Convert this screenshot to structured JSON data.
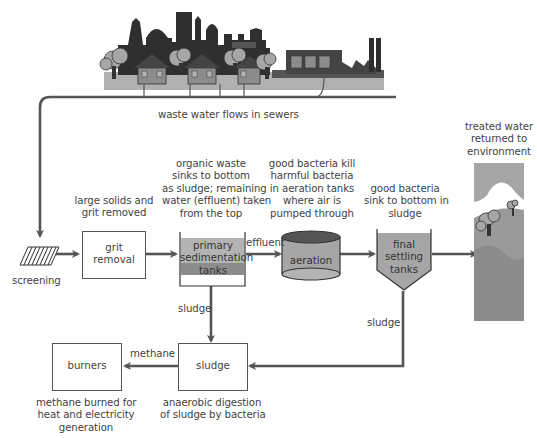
{
  "diagram": {
    "colors": {
      "line": "#555555",
      "silhouette": "#2f2f2f",
      "mid_gray": "#8c8c8c",
      "light_gray": "#b3b3b3",
      "box_fill": "#ffffff",
      "tank_fill": "#a6a6a6",
      "tank_sludge": "#7f7f7f"
    },
    "top_label": "waste water flows in sewers",
    "nodes": {
      "screening": {
        "label": "screening"
      },
      "grit_removal": {
        "label_line1": "grit",
        "label_line2": "removal",
        "note_line1": "large solids and",
        "note_line2": "grit removed"
      },
      "primary": {
        "label_line1": "primary",
        "label_line2": "sedimentation",
        "label_line3": "tanks",
        "note_line1": "organic waste",
        "note_line2": "sinks to bottom",
        "note_line3": "as sludge; remaining",
        "note_line4": "water (effluent) taken",
        "note_line5": "from the top"
      },
      "aeration": {
        "label": "aeration",
        "note_line1": "good bacteria kill",
        "note_line2": "harmful bacteria",
        "note_line3": "in aeration tanks",
        "note_line4": "where air is",
        "note_line5": "pumped through"
      },
      "final_settling": {
        "label_line1": "final",
        "label_line2": "settling",
        "label_line3": "tanks",
        "note_line1": "good bacteria",
        "note_line2": "sink to bottom in",
        "note_line3": "sludge"
      },
      "environment": {
        "note_line1": "treated water",
        "note_line2": "returned to",
        "note_line3": "environment"
      },
      "sludge": {
        "label": "sludge",
        "note_line1": "anaerobic digestion",
        "note_line2": "of sludge by bacteria"
      },
      "burners": {
        "label": "burners",
        "note_line1": "methane burned for",
        "note_line2": "heat and electricity",
        "note_line3": "generation"
      }
    },
    "edge_labels": {
      "effluent": "effluent",
      "sludge_from_primary": "sludge",
      "sludge_from_final": "sludge",
      "methane": "methane"
    }
  }
}
